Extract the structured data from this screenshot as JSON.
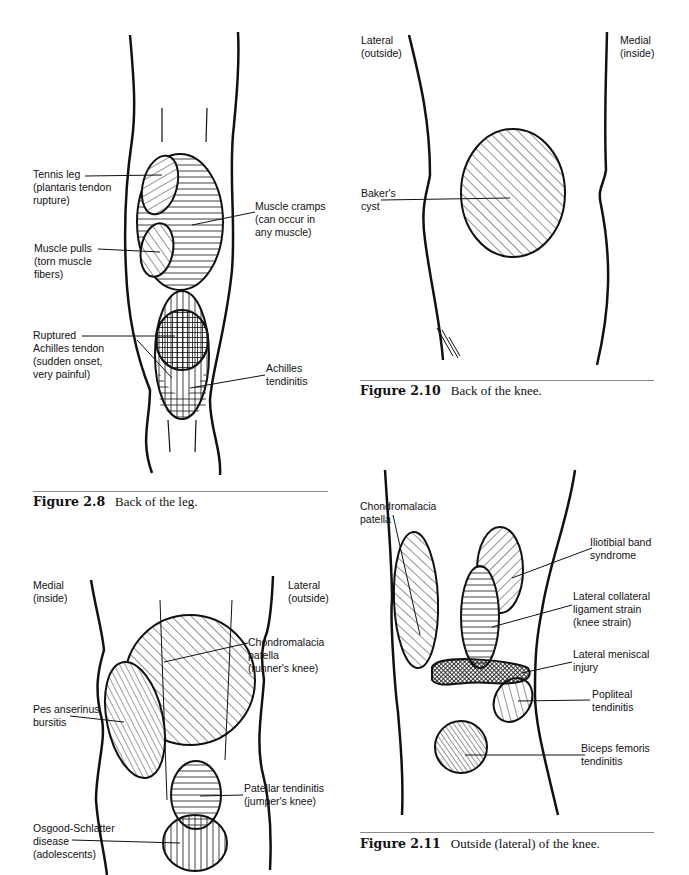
{
  "figures": [
    {
      "id": "fig-2-8",
      "caption_number": "Figure 2.8",
      "caption_text": "Back of the leg.",
      "labels": [
        {
          "text": "Tennis leg\n(plantaris tendon\nrupture)"
        },
        {
          "text": "Muscle cramps\n(can occur in\nany muscle)"
        },
        {
          "text": "Muscle pulls\n(torn muscle\nfibers)"
        },
        {
          "text": "Ruptured\nAchilles tendon\n(sudden onset,\nvery painful)"
        },
        {
          "text": "Achilles\ntendinitis"
        }
      ]
    },
    {
      "id": "fig-2-10",
      "caption_number": "Figure 2.10",
      "caption_text": "Back of the knee.",
      "labels": [
        {
          "text": "Lateral\n(outside)"
        },
        {
          "text": "Medial\n(inside)"
        },
        {
          "text": "Baker's\ncyst"
        }
      ]
    },
    {
      "id": "fig-2-9",
      "labels": [
        {
          "text": "Medial\n(inside)"
        },
        {
          "text": "Lateral\n(outside)"
        },
        {
          "text": "Chondromalacia\npatella\n(runner's knee)"
        },
        {
          "text": "Pes anserinus\nbursitis"
        },
        {
          "text": "Patellar tendinitis\n(jumper's knee)"
        },
        {
          "text": "Osgood-Schlatter\ndisease\n(adolescents)"
        }
      ]
    },
    {
      "id": "fig-2-11",
      "caption_number": "Figure 2.11",
      "caption_text": "Outside (lateral) of the knee.",
      "labels": [
        {
          "text": "Chondromalacia\npatella"
        },
        {
          "text": "Iliotibial band\nsyndrome"
        },
        {
          "text": "Lateral collateral\nligament strain\n(knee strain)"
        },
        {
          "text": "Lateral meniscal\ninjury"
        },
        {
          "text": "Popliteal\ntendinitis"
        },
        {
          "text": "Biceps femoris\ntendinitis"
        }
      ]
    }
  ]
}
